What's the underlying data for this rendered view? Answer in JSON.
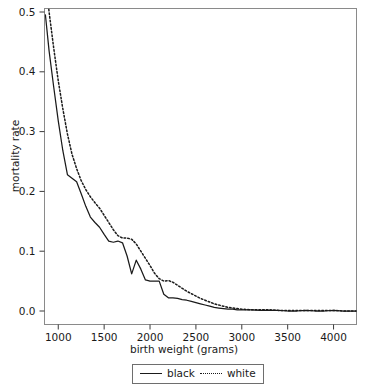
{
  "chart_data": {
    "type": "line",
    "title": "",
    "xlabel": "birth weight (grams)",
    "ylabel": "mortality rate",
    "xlim": [
      850,
      4250
    ],
    "ylim": [
      0.0,
      0.52
    ],
    "grid": false,
    "legend_position": "bottom",
    "xticks": [
      1000,
      1500,
      2000,
      2500,
      3000,
      3500,
      4000
    ],
    "xtick_labels": [
      "1000",
      "1500",
      "2000",
      "2500",
      "3000",
      "3500",
      "4000"
    ],
    "yticks": [
      0.0,
      0.1,
      0.2,
      0.3,
      0.4,
      0.5
    ],
    "ytick_labels": [
      "0.0",
      "0.1",
      "0.2",
      "0.3",
      "0.4",
      "0.5"
    ],
    "series": [
      {
        "name": "black",
        "style": "solid",
        "color": "#1a1a1a",
        "x": [
          860,
          900,
          950,
          1000,
          1050,
          1100,
          1150,
          1200,
          1250,
          1300,
          1350,
          1400,
          1450,
          1500,
          1550,
          1600,
          1650,
          1700,
          1750,
          1800,
          1850,
          1900,
          1950,
          2000,
          2050,
          2100,
          2150,
          2200,
          2250,
          2300,
          2350,
          2400,
          2450,
          2500,
          2550,
          2600,
          2650,
          2700,
          2750,
          2800,
          2850,
          2900,
          2950,
          3000,
          3100,
          3200,
          3300,
          3400,
          3500,
          3600,
          3700,
          3800,
          3900,
          4000,
          4100,
          4250
        ],
        "y": [
          0.495,
          0.435,
          0.375,
          0.318,
          0.268,
          0.228,
          0.222,
          0.216,
          0.196,
          0.175,
          0.157,
          0.148,
          0.14,
          0.128,
          0.117,
          0.115,
          0.117,
          0.114,
          0.092,
          0.062,
          0.085,
          0.07,
          0.052,
          0.05,
          0.05,
          0.05,
          0.028,
          0.022,
          0.022,
          0.021,
          0.019,
          0.018,
          0.016,
          0.014,
          0.012,
          0.01,
          0.008,
          0.006,
          0.005,
          0.004,
          0.003,
          0.003,
          0.002,
          0.002,
          0.002,
          0.001,
          0.001,
          0.001,
          0.0,
          0.0,
          0.001,
          0.0,
          0.0,
          0.001,
          0.0,
          0.0
        ]
      },
      {
        "name": "white",
        "style": "dotted",
        "color": "#1a1a1a",
        "x": [
          860,
          900,
          950,
          1000,
          1050,
          1100,
          1150,
          1200,
          1250,
          1300,
          1350,
          1400,
          1450,
          1500,
          1550,
          1600,
          1650,
          1700,
          1750,
          1800,
          1850,
          1900,
          1950,
          2000,
          2050,
          2100,
          2150,
          2200,
          2250,
          2300,
          2350,
          2400,
          2450,
          2500,
          2550,
          2600,
          2650,
          2700,
          2750,
          2800,
          2850,
          2900,
          2950,
          3000,
          3100,
          3200,
          3300,
          3400,
          3500,
          3600,
          3700,
          3800,
          3900,
          4000,
          4100,
          4250
        ],
        "y": [
          0.56,
          0.5,
          0.44,
          0.385,
          0.338,
          0.296,
          0.262,
          0.238,
          0.218,
          0.203,
          0.191,
          0.181,
          0.172,
          0.16,
          0.148,
          0.136,
          0.126,
          0.122,
          0.122,
          0.12,
          0.112,
          0.1,
          0.088,
          0.076,
          0.063,
          0.054,
          0.05,
          0.051,
          0.048,
          0.043,
          0.038,
          0.033,
          0.029,
          0.025,
          0.021,
          0.018,
          0.015,
          0.012,
          0.01,
          0.008,
          0.006,
          0.005,
          0.004,
          0.003,
          0.002,
          0.002,
          0.002,
          0.001,
          0.001,
          0.001,
          0.001,
          0.001,
          0.001,
          0.001,
          0.0,
          0.0
        ]
      }
    ]
  },
  "legend": {
    "items": [
      {
        "label": "black",
        "marker": "solid-line-swatch"
      },
      {
        "label": "white",
        "marker": "dotted-line-swatch"
      }
    ]
  }
}
